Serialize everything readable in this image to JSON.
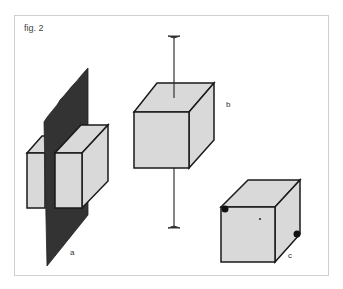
{
  "figure": {
    "caption": "fig. 2",
    "top_cropped_text": "",
    "labels": {
      "a": "a",
      "b": "b",
      "c": "c"
    },
    "colors": {
      "face": "#d9d9d9",
      "edge": "#1a1a1a",
      "plane": "#333333",
      "frame": "#cfcfcf"
    },
    "parts": [
      {
        "id": "a",
        "description": "cube cut by a vertical dark plane into two pieces"
      },
      {
        "id": "b",
        "description": "cube pierced by a vertical rotation axis"
      },
      {
        "id": "c",
        "description": "cube with two marked opposite corners and center point"
      }
    ]
  }
}
